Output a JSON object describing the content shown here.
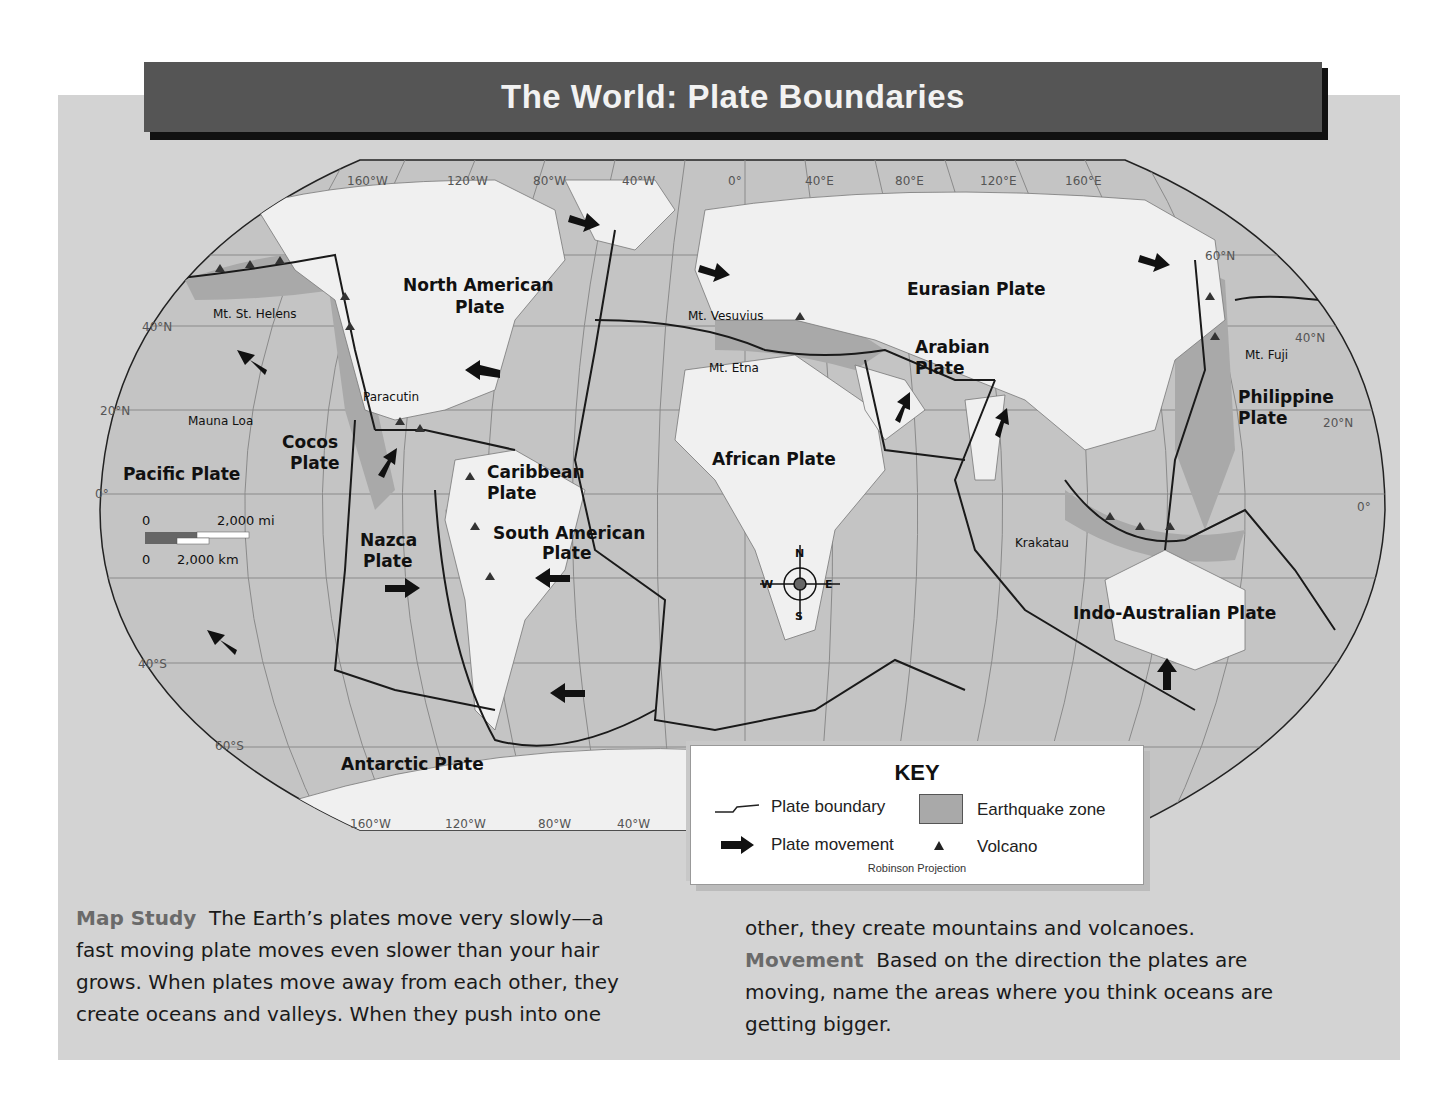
{
  "title": "The World: Plate Boundaries",
  "map": {
    "plates": [
      {
        "name": "North American Plate",
        "lines": [
          "North American",
          "Plate"
        ]
      },
      {
        "name": "Eurasian Plate",
        "lines": [
          "Eurasian Plate"
        ]
      },
      {
        "name": "Arabian Plate",
        "lines": [
          "Arabian",
          "Plate"
        ]
      },
      {
        "name": "Philippine Plate",
        "lines": [
          "Philippine",
          "Plate"
        ]
      },
      {
        "name": "Pacific Plate",
        "lines": [
          "Pacific Plate"
        ]
      },
      {
        "name": "Cocos Plate",
        "lines": [
          "Cocos",
          "Plate"
        ]
      },
      {
        "name": "Caribbean Plate",
        "lines": [
          "Caribbean",
          "Plate"
        ]
      },
      {
        "name": "African Plate",
        "lines": [
          "African Plate"
        ]
      },
      {
        "name": "South American Plate",
        "lines": [
          "South American",
          "Plate"
        ]
      },
      {
        "name": "Nazca Plate",
        "lines": [
          "Nazca",
          "Plate"
        ]
      },
      {
        "name": "Indo-Australian Plate",
        "lines": [
          "Indo-Australian Plate"
        ]
      },
      {
        "name": "Antarctic Plate",
        "lines": [
          "Antarctic Plate"
        ]
      }
    ],
    "volcanoes": [
      "Mt. St. Helens",
      "Mauna Loa",
      "Paracutin",
      "Mt. Vesuvius",
      "Mt. Etna",
      "Mt. Fuji",
      "Krakatau"
    ],
    "longitudes_top": [
      "160°W",
      "120°W",
      "80°W",
      "40°W",
      "0°",
      "40°E",
      "80°E",
      "120°E",
      "160°E"
    ],
    "longitudes_bottom": [
      "160°W",
      "120°W",
      "80°W",
      "40°W"
    ],
    "latitudes_left": [
      "40°N",
      "20°N",
      "0°",
      "40°S",
      "60°S"
    ],
    "latitudes_right": [
      "60°N",
      "40°N",
      "20°N",
      "0°"
    ],
    "scale": {
      "zero_top": "0",
      "miles": "2,000 mi",
      "zero_bottom": "0",
      "km": "2,000 km"
    },
    "compass": {
      "n": "N",
      "s": "S",
      "e": "E",
      "w": "W"
    }
  },
  "key": {
    "title": "KEY",
    "plate_boundary": "Plate boundary",
    "earthquake_zone": "Earthquake zone",
    "plate_movement": "Plate movement",
    "volcano": "Volcano",
    "projection": "Robinson Projection"
  },
  "caption": {
    "left": {
      "lead": "Map Study",
      "lines": [
        "The Earth’s plates move very slowly—a",
        "fast moving plate moves even slower than your hair",
        "grows. When plates move away from each other, they",
        "create oceans and valleys. When they push into one"
      ]
    },
    "right": {
      "line1": "other, they create mountains and volcanoes.",
      "lead": "Movement",
      "lines": [
        "Based on the direction the plates are",
        "moving, name the areas where you think oceans are",
        "getting bigger."
      ]
    }
  },
  "colors": {
    "panel": "#d3d3d3",
    "title_bar": "#555555",
    "ocean": "#c4c4c4",
    "land": "#f0f0f0",
    "earthquake_zone": "#a9a9a9",
    "boundary": "#1a1a1a"
  }
}
